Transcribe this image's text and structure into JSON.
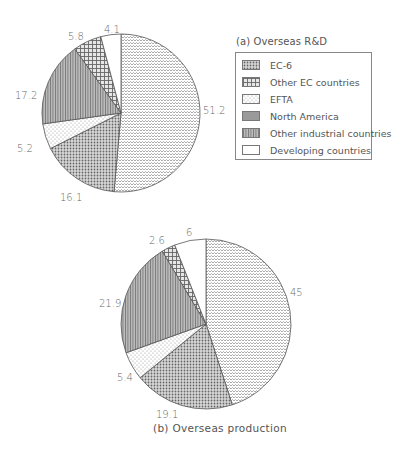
{
  "chart_data": [
    {
      "type": "pie",
      "title": "(a) Overseas R&D",
      "start_angle": "12 o'clock",
      "direction": "clockwise",
      "categories": [
        "EC-6",
        "Other EC countries",
        "EFTA",
        "North America",
        "Other industrial countries",
        "Developing countries"
      ],
      "values": [
        51.2,
        16.1,
        5.2,
        17.2,
        5.8,
        4.1
      ],
      "labels": [
        "51.2",
        "16.1",
        "5.2",
        "17.2",
        "5.8",
        "4.1"
      ]
    },
    {
      "type": "pie",
      "title": "(b) Overseas production",
      "start_angle": "12 o'clock",
      "direction": "clockwise",
      "categories": [
        "EC-6",
        "Other EC countries",
        "EFTA",
        "North America",
        "Other industrial countries",
        "Developing countries"
      ],
      "values": [
        45,
        19.1,
        5.4,
        21.9,
        2.6,
        6
      ],
      "labels": [
        "45",
        "19.1",
        "5.4",
        "21.9",
        "2.6",
        "6"
      ]
    }
  ],
  "legend": {
    "title": "(a) Overseas R&D",
    "position": "top-right",
    "items": [
      {
        "label": "EC-6",
        "pattern": "chevron"
      },
      {
        "label": "Other EC countries",
        "pattern": "dense-dots"
      },
      {
        "label": "EFTA",
        "pattern": "light-dots"
      },
      {
        "label": "North America",
        "pattern": "vertical-stripes"
      },
      {
        "label": "Other industrial countries",
        "pattern": "crosshatch"
      },
      {
        "label": "Developing countries",
        "pattern": "blank"
      }
    ]
  },
  "caption_b": "(b) Overseas production",
  "pie_a_labels": {
    "ec6": "51.2",
    "other_ec": "16.1",
    "efta": "5.2",
    "north_america": "17.2",
    "other_industrial": "5.8",
    "developing": "4.1"
  },
  "pie_b_labels": {
    "ec6": "45",
    "other_ec": "19.1",
    "efta": "5.4",
    "north_america": "21.9",
    "other_industrial": "2.6",
    "developing": "6"
  }
}
